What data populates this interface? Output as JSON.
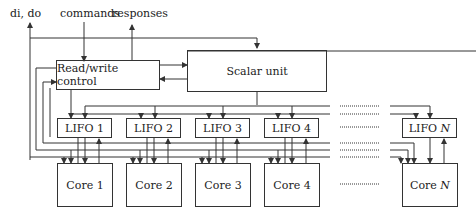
{
  "diagram": {
    "top_labels": {
      "di_do": "di, do",
      "commands": "commands",
      "responses": "responses"
    },
    "blocks": {
      "rw_control": "Read/write control",
      "scalar_unit": "Scalar unit"
    },
    "lifos": [
      {
        "prefix": "LIFO",
        "index": "1"
      },
      {
        "prefix": "LIFO",
        "index": "2"
      },
      {
        "prefix": "LIFO",
        "index": "3"
      },
      {
        "prefix": "LIFO",
        "index": "4"
      },
      {
        "prefix": "LIFO",
        "index": "N"
      }
    ],
    "cores": [
      {
        "prefix": "Core",
        "index": "1"
      },
      {
        "prefix": "Core",
        "index": "2"
      },
      {
        "prefix": "Core",
        "index": "3"
      },
      {
        "prefix": "Core",
        "index": "4"
      },
      {
        "prefix": "Core",
        "index": "N"
      }
    ],
    "colors": {
      "line": "#333333",
      "text": "#222222",
      "background": "#ffffff"
    }
  }
}
